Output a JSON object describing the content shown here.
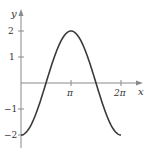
{
  "chart_data": {
    "type": "line",
    "title": "",
    "xlabel": "x",
    "ylabel": "y",
    "function": "y = -2cos(x)",
    "x_domain": [
      0,
      6.2832
    ],
    "xlim": [
      0,
      7.5
    ],
    "ylim": [
      -2.5,
      2.8
    ],
    "grid": false,
    "legend": null,
    "x_ticks": [
      {
        "value": 3.1416,
        "label": "π"
      },
      {
        "value": 6.2832,
        "label": "2π"
      }
    ],
    "y_ticks": [
      {
        "value": 2,
        "label": "2"
      },
      {
        "value": 1,
        "label": "1"
      },
      {
        "value": -1,
        "label": "−1"
      },
      {
        "value": -2,
        "label": "−2"
      }
    ],
    "series": [
      {
        "name": "-2cos(x)",
        "x": [
          0,
          0.7854,
          1.5708,
          2.3562,
          3.1416,
          3.927,
          4.7124,
          5.4978,
          6.2832
        ],
        "y": [
          -2,
          -1.414,
          0,
          1.414,
          2,
          1.414,
          0,
          -1.414,
          -2
        ],
        "color": "#3a3a3a"
      }
    ]
  },
  "colors": {
    "axis": "#8a8a8a",
    "curve": "#3a3a3a",
    "text": "#333333"
  }
}
